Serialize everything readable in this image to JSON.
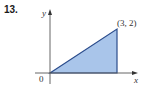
{
  "problem": {
    "number": "13."
  },
  "axes": {
    "x_label": "x",
    "y_label": "y",
    "origin_label": "0"
  },
  "region": {
    "vertices": [
      [
        0,
        0
      ],
      [
        3,
        0
      ],
      [
        3,
        2
      ]
    ],
    "vertex_label": "(3, 2)",
    "fill_color": "#a9c5ea",
    "stroke_color": "#2b4c8c"
  },
  "colors": {
    "axis": "#555555",
    "text": "#333333"
  }
}
